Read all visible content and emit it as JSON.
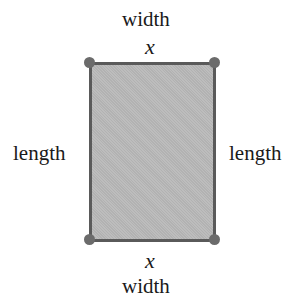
{
  "diagram": {
    "type": "rectangle-dimensions",
    "top": {
      "label": "width",
      "variable": "x"
    },
    "bottom": {
      "label": "width",
      "variable": "x"
    },
    "left": {
      "label": "length"
    },
    "right": {
      "label": "length"
    },
    "colors": {
      "fill": "#b9b9b9",
      "border": "#5a5a5a",
      "vertex": "#6b6b6b",
      "text": "#1a1a1a"
    }
  }
}
